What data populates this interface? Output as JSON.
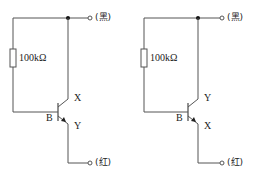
{
  "circuits": [
    {
      "name": "left",
      "resistor_label": "100kΩ",
      "top_terminal_label": "(黑)",
      "bottom_terminal_label": "(红)",
      "base_label": "B",
      "upper_lead_label": "X",
      "lower_lead_label": "Y"
    },
    {
      "name": "right",
      "resistor_label": "100kΩ",
      "top_terminal_label": "(黑)",
      "bottom_terminal_label": "(红)",
      "base_label": "B",
      "upper_lead_label": "Y",
      "lower_lead_label": "X"
    }
  ],
  "colors": {
    "wire": "#555555",
    "text": "#222222",
    "background": "#ffffff"
  }
}
